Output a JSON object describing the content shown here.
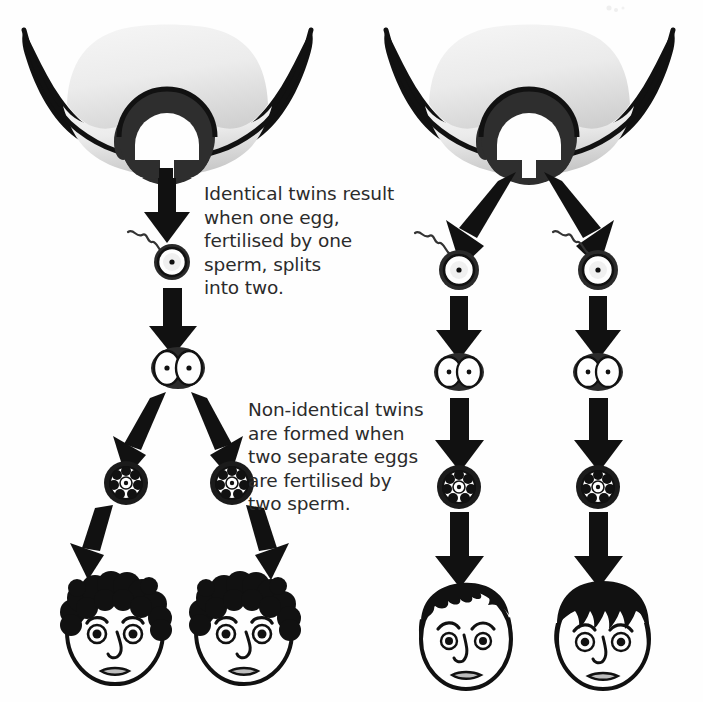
{
  "figure": {
    "background_color": "#fefefe",
    "ink_color": "#111111",
    "uterus_fill_light": "#f2f2f2",
    "uterus_fill_dark": "#cfcfcf",
    "text_color": "#2b2b2b"
  },
  "captions": {
    "identical": "Identical twins result\nwhen one egg,\nfertilised by one\nsperm, splits\ninto two.",
    "non_identical": "Non-identical twins\nare formed when\ntwo separate eggs\nare fertilised by\ntwo sperm."
  },
  "panels": [
    {
      "id": "identical",
      "label": "Identical twins pathway",
      "uterus_label": "uterus-with-fallopian-tubes",
      "stages": [
        {
          "name": "fertilised-egg",
          "label": "One egg fertilised by one sperm",
          "sperm_count": 1
        },
        {
          "name": "two-cell-embryo",
          "label": "Embryo splits into two cells",
          "cell_count": 2
        },
        {
          "name": "morula-left",
          "label": "Morula (left)",
          "cell_count": 1
        },
        {
          "name": "morula-right",
          "label": "Morula (right)",
          "cell_count": 1
        }
      ],
      "babies": [
        {
          "name": "baby-face-left",
          "hair_style": "curly",
          "label": "Identical twin 1"
        },
        {
          "name": "baby-face-right",
          "hair_style": "curly",
          "label": "Identical twin 2"
        }
      ]
    },
    {
      "id": "non-identical",
      "label": "Non-identical twins pathway",
      "uterus_label": "uterus-with-fallopian-tubes",
      "stages": [
        {
          "name": "fertilised-egg-left",
          "label": "Egg one fertilised by sperm one",
          "sperm_count": 1
        },
        {
          "name": "fertilised-egg-right",
          "label": "Egg two fertilised by sperm two",
          "sperm_count": 1
        },
        {
          "name": "two-cell-embryo-left",
          "label": "Two-cell embryo (left)",
          "cell_count": 2
        },
        {
          "name": "two-cell-embryo-right",
          "label": "Two-cell embryo (right)",
          "cell_count": 2
        },
        {
          "name": "morula-left",
          "label": "Morula (left)",
          "cell_count": 1
        },
        {
          "name": "morula-right",
          "label": "Morula (right)",
          "cell_count": 1
        }
      ],
      "babies": [
        {
          "name": "baby-face-left",
          "hair_style": "short-spiky",
          "label": "Non-identical twin 1"
        },
        {
          "name": "baby-face-right",
          "hair_style": "straight-fringe",
          "label": "Non-identical twin 2"
        }
      ]
    }
  ]
}
